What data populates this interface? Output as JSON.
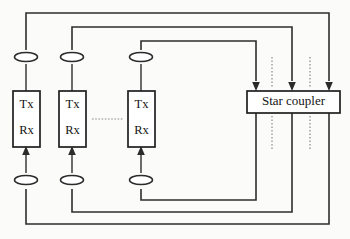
{
  "diagram": {
    "background_color": "#fbfbfa",
    "line_color": "#2e2e2e",
    "nodes": [
      {
        "id": "terminal-1",
        "tx_label": "Tx",
        "rx_label": "Rx",
        "x": 13,
        "y": 91,
        "width": 27,
        "height": 56
      },
      {
        "id": "terminal-2",
        "tx_label": "Tx",
        "rx_label": "Rx",
        "x": 59,
        "y": 91,
        "width": 27,
        "height": 56
      },
      {
        "id": "terminal-n",
        "tx_label": "Tx",
        "rx_label": "Rx",
        "x": 128,
        "y": 91,
        "width": 27,
        "height": 56
      }
    ],
    "coupler": {
      "id": "star-coupler",
      "label": "Star coupler",
      "x": 247,
      "y": 91,
      "width": 93,
      "height": 22
    },
    "couplers_taps": [
      {
        "id": "tap-top-1",
        "cx": 26,
        "cy": 57
      },
      {
        "id": "tap-top-2",
        "cx": 72,
        "cy": 57
      },
      {
        "id": "tap-top-3",
        "cx": 141,
        "cy": 57
      },
      {
        "id": "tap-bottom-1",
        "cx": 26,
        "cy": 180
      },
      {
        "id": "tap-bottom-2",
        "cx": 72,
        "cy": 180
      },
      {
        "id": "tap-bottom-3",
        "cx": 141,
        "cy": 180
      }
    ],
    "input_arrows": [
      {
        "id": "coupler-input-1",
        "x": 256
      },
      {
        "id": "coupler-input-2",
        "x": 292
      },
      {
        "id": "coupler-input-3",
        "x": 329
      }
    ],
    "output_ports": [
      {
        "id": "coupler-output-1",
        "x": 256
      },
      {
        "id": "coupler-output-2",
        "x": 292
      },
      {
        "id": "coupler-output-3",
        "x": 329
      }
    ],
    "continuation_marks": [
      {
        "id": "coupler-dots-upper-1",
        "x": 272
      },
      {
        "id": "coupler-dots-upper-2",
        "x": 310
      },
      {
        "id": "coupler-dots-lower-1",
        "x": 272
      },
      {
        "id": "coupler-dots-lower-2",
        "x": 310
      }
    ],
    "ellipsis": {
      "id": "node-ellipsis",
      "x1": 92,
      "x2": 123,
      "y": 119
    },
    "transmit_paths": [
      {
        "id": "tx-path-1",
        "from": "terminal-1",
        "to": "coupler-input-3",
        "top_y": 13
      },
      {
        "id": "tx-path-2",
        "from": "terminal-2",
        "to": "coupler-input-2",
        "top_y": 27
      },
      {
        "id": "tx-path-3",
        "from": "terminal-n",
        "to": "coupler-input-1",
        "top_y": 41
      }
    ],
    "receive_paths": [
      {
        "id": "rx-path-1",
        "from": "coupler-output-3",
        "to": "terminal-1",
        "bottom_y": 224
      },
      {
        "id": "rx-path-2",
        "from": "coupler-output-2",
        "to": "terminal-2",
        "bottom_y": 212
      },
      {
        "id": "rx-path-3",
        "from": "coupler-output-1",
        "to": "terminal-n",
        "bottom_y": 200
      }
    ]
  }
}
